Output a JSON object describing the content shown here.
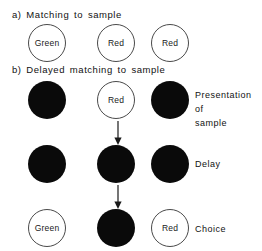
{
  "figure": {
    "width": 262,
    "height": 251,
    "background": "#ffffff",
    "ink_color": "#0a0a0a",
    "outline_color": "#4a4a4a"
  },
  "sections": {
    "a": {
      "title": "a) Matching to sample",
      "stimuli": [
        {
          "label": "Green",
          "fill": "open"
        },
        {
          "label": "Red",
          "fill": "open"
        },
        {
          "label": "Red",
          "fill": "open"
        }
      ]
    },
    "b": {
      "title": "b) Delayed  matching  to sample",
      "rows": [
        {
          "phase_label": "Presentation of\nsample",
          "stimuli": [
            {
              "label": "",
              "fill": "filled"
            },
            {
              "label": "Red",
              "fill": "open"
            },
            {
              "label": "",
              "fill": "filled"
            }
          ]
        },
        {
          "phase_label": "Delay",
          "stimuli": [
            {
              "label": "",
              "fill": "filled"
            },
            {
              "label": "",
              "fill": "filled"
            },
            {
              "label": "",
              "fill": "filled"
            }
          ]
        },
        {
          "phase_label": "Choice",
          "stimuli": [
            {
              "label": "Green",
              "fill": "open"
            },
            {
              "label": "",
              "fill": "filled"
            },
            {
              "label": "Red",
              "fill": "open"
            }
          ]
        }
      ],
      "arrows": [
        {
          "name": "arrow-presentation-to-delay",
          "direction": "down"
        },
        {
          "name": "arrow-delay-to-choice",
          "direction": "down"
        }
      ]
    }
  }
}
